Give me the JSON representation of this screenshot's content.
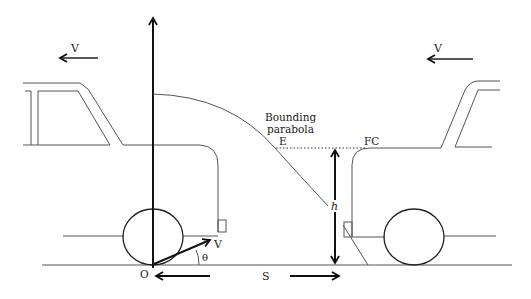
{
  "figure": {
    "type": "physics-diagram"
  },
  "labels": {
    "velocity_left": "V",
    "velocity_right": "V",
    "bounding_parabola_line1": "Bounding",
    "bounding_parabola_line2": "parabola",
    "point_e": "E",
    "point_fc": "FC",
    "height": "h",
    "launch_velocity": "V",
    "angle": "θ",
    "origin": "O",
    "separation": "S"
  },
  "colors": {
    "line": "#555555",
    "bold_line": "#111111",
    "background": "#ffffff"
  }
}
